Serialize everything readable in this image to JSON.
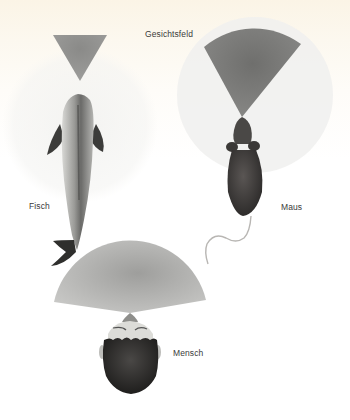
{
  "figure": {
    "title": "Gesichtsfeld",
    "subjects": [
      {
        "id": "fisch",
        "label": "Fisch"
      },
      {
        "id": "maus",
        "label": "Maus"
      },
      {
        "id": "mensch",
        "label": "Mensch"
      }
    ]
  },
  "colors": {
    "background_top": "#fbf4e6",
    "field_of_view": "#8c8c8c",
    "field_of_view_light": "#c6c6c6",
    "peripheral_halo": "#f1f1f1",
    "label_text": "#3a3a3a"
  }
}
